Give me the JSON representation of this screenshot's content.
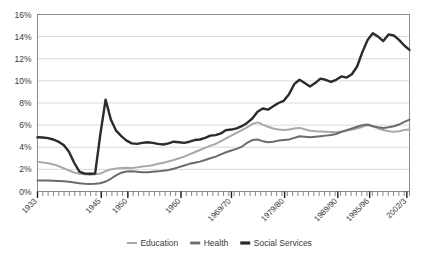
{
  "chart_data": {
    "type": "line",
    "title": "",
    "subtitle": "",
    "xlabel": "",
    "ylabel": "",
    "ylim": [
      0,
      16
    ],
    "ytick_labels": [
      "0%",
      "2%",
      "4%",
      "6%",
      "8%",
      "10%",
      "12%",
      "14%",
      "16%"
    ],
    "ytick_values": [
      0,
      2,
      4,
      6,
      8,
      10,
      12,
      14,
      16
    ],
    "xlim": [
      1933,
      2003
    ],
    "xtick_labels": [
      "1933",
      "1945",
      "1950",
      "1960",
      "1969/70",
      "1979/80",
      "1989/90",
      "1995/96",
      "2002/3"
    ],
    "xtick_values": [
      1933,
      1945,
      1950,
      1960,
      1969.5,
      1979.5,
      1989.5,
      1995.5,
      2002.5
    ],
    "minor_tick_interval": 1,
    "grid": "horizontal",
    "legend_position": "bottom",
    "series": [
      {
        "name": "Education",
        "color": "#a8a8a8",
        "values": [
          2.7,
          2.62,
          2.55,
          2.45,
          2.3,
          2.1,
          1.9,
          1.72,
          1.6,
          1.55,
          1.52,
          1.55,
          1.62,
          1.85,
          2.0,
          2.08,
          2.12,
          2.15,
          2.12,
          2.18,
          2.25,
          2.3,
          2.38,
          2.5,
          2.6,
          2.72,
          2.85,
          3.0,
          3.15,
          3.35,
          3.55,
          3.75,
          3.95,
          4.15,
          4.3,
          4.55,
          4.8,
          5.05,
          5.3,
          5.55,
          5.8,
          6.1,
          6.25,
          6.05,
          5.85,
          5.7,
          5.6,
          5.55,
          5.6,
          5.7,
          5.75,
          5.62,
          5.5,
          5.45,
          5.42,
          5.4,
          5.38,
          5.35,
          5.4,
          5.5,
          5.6,
          5.7,
          5.85,
          6.0,
          5.9,
          5.7,
          5.55,
          5.45,
          5.4,
          5.45,
          5.55,
          5.6
        ]
      },
      {
        "name": "Health",
        "color": "#6b6b6b",
        "values": [
          1.0,
          1.0,
          1.0,
          0.98,
          0.95,
          0.92,
          0.88,
          0.82,
          0.75,
          0.7,
          0.68,
          0.7,
          0.75,
          0.9,
          1.15,
          1.45,
          1.7,
          1.8,
          1.82,
          1.78,
          1.75,
          1.75,
          1.78,
          1.82,
          1.88,
          1.95,
          2.05,
          2.2,
          2.35,
          2.5,
          2.6,
          2.7,
          2.85,
          3.0,
          3.15,
          3.35,
          3.55,
          3.7,
          3.85,
          4.05,
          4.4,
          4.65,
          4.7,
          4.55,
          4.45,
          4.5,
          4.6,
          4.65,
          4.7,
          4.85,
          5.0,
          4.95,
          4.9,
          4.95,
          5.0,
          5.05,
          5.1,
          5.2,
          5.4,
          5.55,
          5.7,
          5.85,
          6.0,
          6.05,
          5.9,
          5.8,
          5.75,
          5.8,
          5.9,
          6.05,
          6.3,
          6.5
        ]
      },
      {
        "name": "Social Services",
        "color": "#2b2b2b",
        "values": [
          4.9,
          4.88,
          4.82,
          4.7,
          4.5,
          4.2,
          3.6,
          2.6,
          1.8,
          1.62,
          1.6,
          1.62,
          5.2,
          8.3,
          6.5,
          5.5,
          5.0,
          4.6,
          4.35,
          4.3,
          4.4,
          4.45,
          4.4,
          4.3,
          4.25,
          4.35,
          4.5,
          4.45,
          4.4,
          4.5,
          4.65,
          4.7,
          4.85,
          5.05,
          5.1,
          5.25,
          5.55,
          5.6,
          5.7,
          5.9,
          6.2,
          6.6,
          7.2,
          7.5,
          7.4,
          7.7,
          8.0,
          8.2,
          8.8,
          9.7,
          10.1,
          9.8,
          9.5,
          9.8,
          10.2,
          10.1,
          9.9,
          10.1,
          10.4,
          10.3,
          10.6,
          11.3,
          12.6,
          13.7,
          14.3,
          14.0,
          13.6,
          14.2,
          14.1,
          13.7,
          13.2,
          12.8
        ]
      }
    ]
  },
  "legend": {
    "items": [
      {
        "label": "Education",
        "color": "#a8a8a8"
      },
      {
        "label": "Health",
        "color": "#6b6b6b"
      },
      {
        "label": "Social Services",
        "color": "#2b2b2b"
      }
    ]
  },
  "axes": {
    "y_title": "",
    "x_title": ""
  },
  "style": {
    "plot_border": "#8c8c8c",
    "gridline": "#c9c9c9",
    "tick": "#555555",
    "text": "#3a3a3a"
  }
}
